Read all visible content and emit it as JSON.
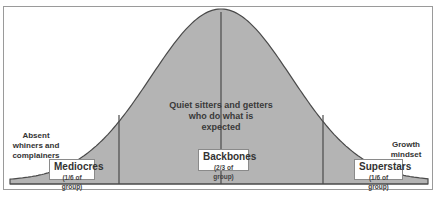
{
  "diagram": {
    "type": "bell-curve",
    "colors": {
      "fill": "#b4b4b4",
      "stroke": "#4a4a4a",
      "frame": "#9a9a9a",
      "background": "#ffffff"
    },
    "center_text": "Quiet sitters and getters who do what is expected",
    "left_text": "Absent whiners and complainers",
    "right_text": "Growth mindset",
    "segments": [
      {
        "title": "Mediocres",
        "subtitle": "(1/6 of group)"
      },
      {
        "title": "Backbones",
        "subtitle": "(2/3 of group)"
      },
      {
        "title": "Superstars",
        "subtitle": "(1/6 of group)"
      }
    ]
  }
}
